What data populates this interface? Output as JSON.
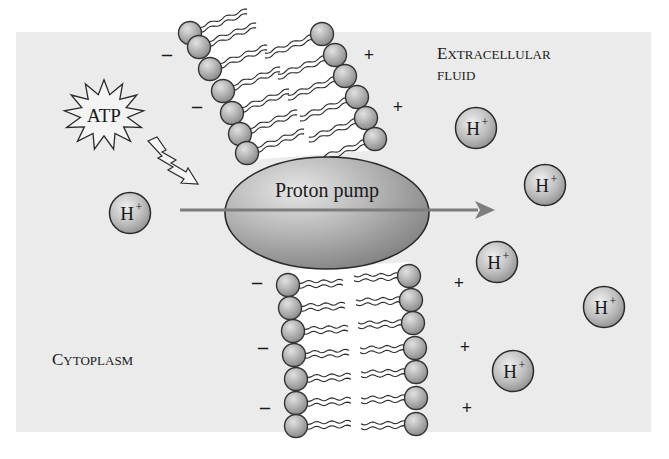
{
  "figure": {
    "panel": {
      "x": 16,
      "y": 32,
      "width": 635,
      "height": 400,
      "background": "#ebebeb"
    },
    "colors": {
      "background": "#ebebeb",
      "membrane_core": "#ffffff",
      "head_fill": "#b4b4b4",
      "head_stroke": "#3a3a3a",
      "pump_fill": "#a9a9a9",
      "arrow": "#7d7d7d",
      "text": "#1a1a1a"
    },
    "labels": {
      "extracellular_first": "E",
      "extracellular_rest": "XTRACELLULAR",
      "fluid": "FLUID",
      "cytoplasm_first": "C",
      "cytoplasm_rest": "YTOPLASM",
      "proton_pump": "Proton pump",
      "atp": "ATP"
    },
    "ion": {
      "symbol": "H",
      "charge": "+"
    },
    "ions": [
      {
        "x": 130,
        "y": 213
      },
      {
        "x": 476,
        "y": 128
      },
      {
        "x": 545,
        "y": 185
      },
      {
        "x": 497,
        "y": 262
      },
      {
        "x": 604,
        "y": 307
      },
      {
        "x": 513,
        "y": 371
      }
    ],
    "charges": {
      "negative": [
        {
          "x": 167,
          "y": 55
        },
        {
          "x": 197,
          "y": 107
        },
        {
          "x": 257,
          "y": 283
        },
        {
          "x": 263,
          "y": 348
        },
        {
          "x": 265,
          "y": 408
        }
      ],
      "positive": [
        {
          "x": 369,
          "y": 55
        },
        {
          "x": 398,
          "y": 107
        },
        {
          "x": 459,
          "y": 283
        },
        {
          "x": 465,
          "y": 347
        },
        {
          "x": 467,
          "y": 408
        }
      ],
      "negative_symbol": "–",
      "positive_symbol": "+"
    },
    "membrane": {
      "upper_left_heads": [
        [
          190,
          33
        ],
        [
          199,
          47
        ],
        [
          210,
          69
        ],
        [
          223,
          91
        ],
        [
          232,
          113
        ],
        [
          240,
          134
        ],
        [
          247,
          153
        ]
      ],
      "upper_right_heads": [
        [
          322,
          34
        ],
        [
          335,
          55
        ],
        [
          345,
          76
        ],
        [
          357,
          97
        ],
        [
          366,
          118
        ],
        [
          375,
          139
        ]
      ],
      "lower_left_heads": [
        [
          288,
          285
        ],
        [
          290,
          308
        ],
        [
          293,
          331
        ],
        [
          294,
          355
        ],
        [
          296,
          379
        ],
        [
          296,
          403
        ],
        [
          296,
          426
        ]
      ],
      "lower_right_heads": [
        [
          409,
          276
        ],
        [
          411,
          300
        ],
        [
          413,
          323
        ],
        [
          415,
          348
        ],
        [
          416,
          372
        ],
        [
          416,
          398
        ],
        [
          416,
          424
        ]
      ]
    },
    "pump": {
      "cx": 327,
      "cy": 213,
      "rx": 102,
      "ry": 56
    },
    "arrow": {
      "x1": 180,
      "y1": 210,
      "x2": 493,
      "y2": 210
    },
    "atp_star": {
      "cx": 104,
      "cy": 115,
      "r_outer": 37,
      "r_inner": 22,
      "points": 13
    }
  }
}
